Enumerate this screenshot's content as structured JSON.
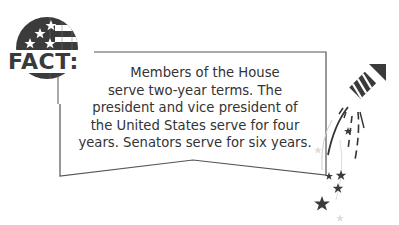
{
  "badge": {
    "label": "FACT:",
    "icon": "american-flag-circle-icon"
  },
  "fact": {
    "lines": [
      "Members of the House",
      "serve two-year terms. The",
      "president and vice president of",
      "the United States serve for four",
      "years. Senators serve for six years."
    ]
  },
  "decoration": {
    "icon": "firework-rocket-with-stars-icon"
  },
  "colors": {
    "ink": "#3a3a3a",
    "text": "#333333",
    "background": "#ffffff"
  }
}
